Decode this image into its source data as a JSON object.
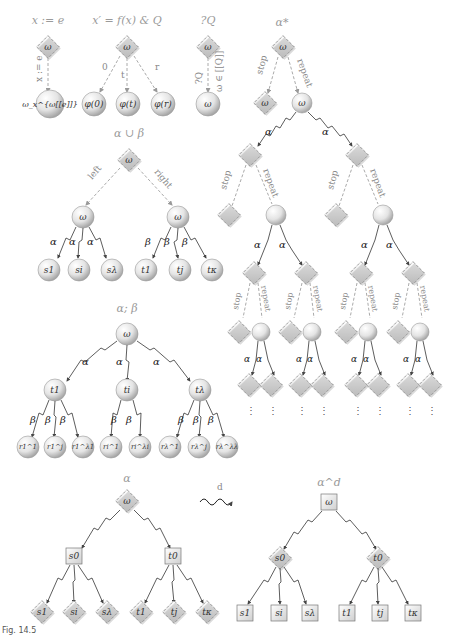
{
  "figure": {
    "caption": "Fig. 14.5",
    "panels": {
      "assign": {
        "title": "x := e",
        "edge_label": "x := e",
        "root": "ω",
        "child": "ω_x^{ω[[e]]}"
      },
      "ode": {
        "title": "x′ = f(x) & Q",
        "root": "ω",
        "edge_labels": [
          "0",
          "t",
          "r"
        ],
        "children": [
          "φ(0)",
          "φ(t)",
          "φ(r)"
        ]
      },
      "test": {
        "title": "?Q",
        "root": "ω",
        "edge_label_left": "?Q",
        "edge_label_right": "ω ∈ [[Q]]",
        "child": "ω"
      },
      "repeat": {
        "title": "α*",
        "root": "ω",
        "stop_label": "stop",
        "repeat_label": "repeat",
        "alpha": "α",
        "stop_child": "ω",
        "repeat_child": "ω",
        "ellipsis": "⋮"
      },
      "choice": {
        "title": "α ∪ β",
        "root": "ω",
        "left_label": "left",
        "right_label": "right",
        "left_node": "ω",
        "right_node": "ω",
        "alpha": "α",
        "beta": "β",
        "left_children": [
          "s1",
          "si",
          "sλ"
        ],
        "right_children": [
          "t1",
          "tj",
          "tκ"
        ]
      },
      "sequence": {
        "title": "α; β",
        "root": "ω",
        "alpha": "α",
        "beta": "β",
        "mid": [
          "t1",
          "ti",
          "tλ"
        ],
        "leaves": [
          "r1^1",
          "r1^j",
          "r1^λ1",
          "ri^1",
          "ri^λi",
          "rλ^1",
          "rλ^j",
          "rλ^λλ"
        ]
      },
      "dual_left": {
        "title": "α",
        "root": "ω",
        "mid": [
          "s0",
          "t0"
        ],
        "leaves": [
          "s1",
          "si",
          "sλ",
          "t1",
          "tj",
          "tκ"
        ]
      },
      "dual_arrow": {
        "label": "d"
      },
      "dual_right": {
        "title": "α^d",
        "root": "ω",
        "mid": [
          "s0",
          "t0"
        ],
        "leaves": [
          "s1",
          "si",
          "sλ",
          "t1",
          "tj",
          "tκ"
        ]
      }
    }
  }
}
